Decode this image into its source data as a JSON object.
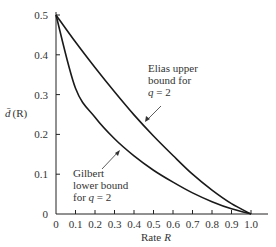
{
  "chart_data": {
    "type": "line",
    "title": "",
    "xlabel": "Rate R",
    "ylabel": "d̄ (R)",
    "xlim": [
      0,
      1.0
    ],
    "ylim": [
      0,
      0.5
    ],
    "grid": false,
    "x_ticks": [
      "0",
      "0.1",
      "0.2",
      "0.3",
      "0.4",
      "0.5",
      "0.6",
      "0.7",
      "0.8",
      "0.9",
      "1.0"
    ],
    "y_ticks": [
      "0",
      "0.1",
      "0.2",
      "0.3",
      "0.4",
      "0.5"
    ],
    "x": [
      0,
      0.1,
      0.2,
      0.3,
      0.4,
      0.5,
      0.6,
      0.7,
      0.8,
      0.9,
      1.0
    ],
    "series": [
      {
        "name": "Elias upper bound for q = 2",
        "values": [
          0.5,
          0.432,
          0.368,
          0.307,
          0.249,
          0.196,
          0.147,
          0.1,
          0.06,
          0.026,
          0
        ]
      },
      {
        "name": "Gilbert lower bound for q = 2",
        "values": [
          0.5,
          0.316,
          0.243,
          0.189,
          0.146,
          0.11,
          0.08,
          0.053,
          0.031,
          0.013,
          0
        ]
      }
    ],
    "annotations": [
      {
        "lines": [
          "Elias upper",
          "bound for",
          "q = 2"
        ],
        "target_series": "Elias upper bound for q = 2"
      },
      {
        "lines": [
          "Gilbert",
          "lower bound",
          "for q = 2"
        ],
        "target_series": "Gilbert lower bound for q = 2"
      }
    ]
  },
  "labels": {
    "ylabel_d": "d̄",
    "ylabel_r": "(R)",
    "xlabel_rate": "Rate",
    "xlabel_r": "R",
    "elias": [
      "Elias upper",
      "bound for",
      "q",
      " = 2"
    ],
    "gilbert": [
      "Gilbert",
      "lower bound",
      "for ",
      "q",
      " = 2"
    ]
  }
}
